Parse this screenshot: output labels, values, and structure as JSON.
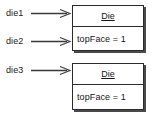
{
  "diagram": {
    "type": "uml-object-diagram",
    "background_color": "#ffffff",
    "line_color": "#2b2b2b",
    "shadow_color": "#4a4a4a",
    "text_color": "#141414"
  },
  "references": [
    {
      "label": "die1",
      "target": "object-1"
    },
    {
      "label": "die2",
      "target": "object-1"
    },
    {
      "label": "die3",
      "target": "object-2"
    }
  ],
  "objects": [
    {
      "id": "object-1",
      "class_name": "Die",
      "attributes": [
        {
          "text": "topFace = 1",
          "name": "topFace",
          "value": "1"
        }
      ]
    },
    {
      "id": "object-2",
      "class_name": "Die",
      "attributes": [
        {
          "text": "topFace = 1",
          "name": "topFace",
          "value": "1"
        }
      ]
    }
  ],
  "arrows": [
    {
      "name": "arrow-die1",
      "direction": "right",
      "style": "solid-open-head"
    },
    {
      "name": "arrow-die2",
      "direction": "right",
      "style": "solid-open-head"
    },
    {
      "name": "arrow-die3",
      "direction": "right",
      "style": "solid-open-head"
    }
  ]
}
